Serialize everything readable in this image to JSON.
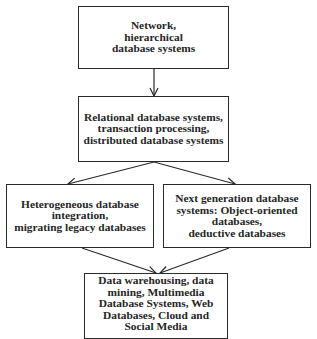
{
  "diagram": {
    "nodes": [
      {
        "id": "n1",
        "label": "Network,\nhierarchical\ndatabase systems"
      },
      {
        "id": "n2",
        "label": "Relational database systems,\ntransaction processing,\ndistributed database systems"
      },
      {
        "id": "n3",
        "label": "Heterogeneous database\nintegration,\nmigrating legacy databases"
      },
      {
        "id": "n4",
        "label": "Next generation database\nsystems:  Object-oriented\ndatabases,\ndeductive databases"
      },
      {
        "id": "n5",
        "label": "Data warehousing, data\nmining,  Multimedia\nDatabase  Systems, Web\nDatabases, Cloud and\nSocial Media"
      }
    ],
    "edges": [
      {
        "from": "n1",
        "to": "n2"
      },
      {
        "from": "n2",
        "to": "n3"
      },
      {
        "from": "n2",
        "to": "n4"
      },
      {
        "from": "n3",
        "to": "n5"
      },
      {
        "from": "n4",
        "to": "n5"
      }
    ],
    "colors": {
      "line": "#2a2a2a",
      "text": "#262626",
      "background": "#ffffff"
    }
  }
}
